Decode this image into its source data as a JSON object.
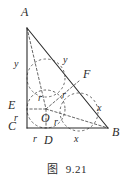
{
  "figure": {
    "type": "geometry-diagram",
    "caption": {
      "prefix": "图",
      "number": "9.21"
    },
    "stroke_color": "#2b2b2b",
    "dash_color": "#555555",
    "background": "#ffffff",
    "vertices": [
      {
        "name": "A",
        "label": "A",
        "x": 27,
        "y": 28,
        "label_x": 21,
        "label_y": 6
      },
      {
        "name": "B",
        "label": "B",
        "x": 108,
        "y": 128,
        "label_x": 112,
        "label_y": 126
      },
      {
        "name": "C",
        "label": "C",
        "x": 27,
        "y": 128,
        "label_x": 8,
        "label_y": 120
      },
      {
        "name": "D",
        "label": "D",
        "x": 46,
        "y": 128,
        "label_x": 44,
        "label_y": 134
      },
      {
        "name": "E",
        "label": "E",
        "x": 27,
        "y": 109,
        "label_x": 8,
        "label_y": 99
      },
      {
        "name": "F",
        "label": "F",
        "x": 79,
        "y": 81,
        "label_x": 83,
        "label_y": 68
      },
      {
        "name": "O",
        "label": "O",
        "x": 46,
        "y": 109,
        "label_x": 41,
        "label_y": 112
      }
    ],
    "segment_labels": [
      {
        "name": "side-AE-length",
        "text": "y",
        "x": 14,
        "y": 59
      },
      {
        "name": "side-AF-length",
        "text": "y",
        "x": 63,
        "y": 55
      },
      {
        "name": "side-FB-length",
        "text": "x",
        "x": 97,
        "y": 103
      },
      {
        "name": "side-DB-length",
        "text": "x",
        "x": 74,
        "y": 134
      },
      {
        "name": "side-CD-length",
        "text": "r",
        "x": 33,
        "y": 134
      },
      {
        "name": "side-CE-length",
        "text": "r",
        "x": 14,
        "y": 113
      },
      {
        "name": "radius-OE-length",
        "text": "r",
        "x": 38,
        "y": 93
      },
      {
        "name": "radius-OF-length",
        "text": "r",
        "x": 62,
        "y": 90
      },
      {
        "name": "radius-OD-length",
        "text": "r",
        "x": 54,
        "y": 117
      }
    ],
    "geometry": {
      "circle": {
        "cx": 46,
        "cy": 109,
        "r": 19
      },
      "solid_segments": [
        {
          "name": "segment-AC",
          "x1": 27,
          "y1": 28,
          "x2": 27,
          "y2": 128
        },
        {
          "name": "segment-CB",
          "x1": 27,
          "y1": 128,
          "x2": 108,
          "y2": 128
        },
        {
          "name": "segment-AB",
          "x1": 27,
          "y1": 28,
          "x2": 108,
          "y2": 128
        }
      ],
      "dashed_segments": [
        {
          "name": "segment-AO",
          "x1": 27,
          "y1": 28,
          "x2": 46,
          "y2": 109
        },
        {
          "name": "segment-OF",
          "x1": 46,
          "y1": 109,
          "x2": 79,
          "y2": 81
        },
        {
          "name": "segment-OB",
          "x1": 46,
          "y1": 109,
          "x2": 108,
          "y2": 128
        },
        {
          "name": "segment-OE",
          "x1": 46,
          "y1": 109,
          "x2": 27,
          "y2": 109
        },
        {
          "name": "segment-OD",
          "x1": 46,
          "y1": 109,
          "x2": 46,
          "y2": 128
        }
      ],
      "dashed_arcs": [
        {
          "name": "arc-A-construction",
          "cx": 46,
          "cy": 78,
          "r": 19
        },
        {
          "name": "arc-B-construction",
          "cx": 79,
          "cy": 112,
          "r": 19
        }
      ]
    }
  }
}
